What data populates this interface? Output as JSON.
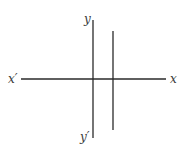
{
  "diagram": {
    "type": "coordinate-axes",
    "labels": {
      "x_positive": "x",
      "x_negative": "x′",
      "y_positive": "y",
      "y_negative": "y′"
    },
    "lines": [
      {
        "id": "x-axis",
        "x1": 21,
        "y1": 79,
        "x2": 166,
        "y2": 79
      },
      {
        "id": "y-axis",
        "x1": 93,
        "y1": 20,
        "x2": 93,
        "y2": 138
      },
      {
        "id": "vertical-line",
        "x1": 113,
        "y1": 31,
        "x2": 113,
        "y2": 130
      }
    ],
    "line_color": "#2a2a2a"
  }
}
